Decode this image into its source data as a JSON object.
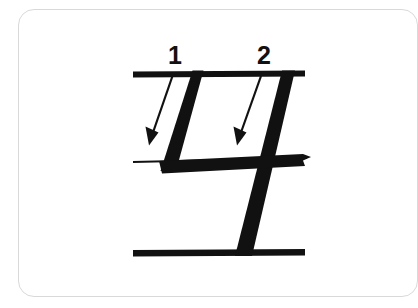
{
  "card": {
    "border_color": "#d9d9d9",
    "background": "#ffffff"
  },
  "diagram": {
    "title": "",
    "type": "stroke-order-writing-guide",
    "ink_color": "#111111",
    "guideline_color": "#111111",
    "canvas": {
      "width": 395,
      "height": 308
    },
    "guidelines": [
      {
        "name": "top-line",
        "y": 73,
        "x1": 133,
        "x2": 305,
        "thickness": 6,
        "weight": "thick"
      },
      {
        "name": "middle-line",
        "y": 161,
        "x1": 133,
        "x2": 305,
        "thickness": 2,
        "weight": "thin"
      },
      {
        "name": "bottom-line",
        "y": 253,
        "x1": 133,
        "x2": 305,
        "thickness": 6,
        "weight": "thick"
      }
    ],
    "strokes": [
      {
        "order": 1,
        "label": "1",
        "name": "stroke-1-diagonal",
        "start": {
          "x": 197,
          "y": 72
        },
        "end": {
          "x": 166,
          "y": 170
        },
        "width": 15,
        "direction": "down-left"
      },
      {
        "order": 2,
        "label": "2",
        "name": "stroke-2-diagonal",
        "start": {
          "x": 288,
          "y": 72
        },
        "end": {
          "x": 242,
          "y": 256
        },
        "width": 15,
        "direction": "down-left"
      },
      {
        "order": 3,
        "label": "",
        "name": "stroke-horizontal-bar",
        "start": {
          "x": 160,
          "y": 167
        },
        "end": {
          "x": 307,
          "y": 160
        },
        "width": 12,
        "direction": "right"
      }
    ],
    "arrows": [
      {
        "for_stroke": 1,
        "name": "stroke-1-direction-arrow",
        "start": {
          "x": 170,
          "y": 77
        },
        "end": {
          "x": 150,
          "y": 140
        },
        "line_width": 2,
        "head": "filled-triangle"
      },
      {
        "for_stroke": 2,
        "name": "stroke-2-direction-arrow",
        "start": {
          "x": 259,
          "y": 77
        },
        "end": {
          "x": 236,
          "y": 140
        },
        "line_width": 2,
        "head": "filled-triangle"
      }
    ],
    "stroke_numbers": [
      {
        "label": "1",
        "x": 176,
        "y": 55
      },
      {
        "label": "2",
        "x": 266,
        "y": 55
      }
    ]
  }
}
